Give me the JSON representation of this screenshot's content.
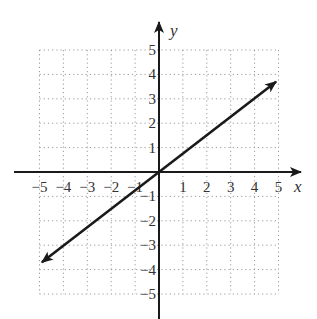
{
  "chart_data": {
    "type": "line",
    "title": "",
    "xlabel": "x",
    "ylabel": "y",
    "xlim": [
      -5,
      5
    ],
    "ylim": [
      -5,
      5
    ],
    "grid": true,
    "grid_style": "dotted",
    "x_ticks": [
      "-5",
      "-4",
      "-3",
      "-2",
      "-1",
      "1",
      "2",
      "3",
      "4",
      "5"
    ],
    "y_ticks": [
      "5",
      "4",
      "3",
      "2",
      "1",
      "-1",
      "-2",
      "-3",
      "-4",
      "-5"
    ],
    "series": [
      {
        "name": "line",
        "equation": "y = 0.75x",
        "x": [
          -4.9,
          0,
          4.9
        ],
        "y": [
          -3.7,
          0,
          3.7
        ],
        "arrows": "both ends"
      }
    ],
    "legend": null
  },
  "colors": {
    "axis": "#1a1a1a",
    "grid": "#9a9a9a",
    "line": "#1a1a1a",
    "text": "#333333"
  }
}
